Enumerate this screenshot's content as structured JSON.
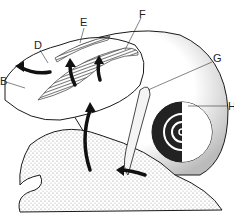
{
  "diagram": {
    "type": "anatomical-illustration",
    "labels": [
      {
        "id": "B",
        "text": "B",
        "x": 0,
        "y": 76
      },
      {
        "id": "D",
        "text": "D",
        "x": 34,
        "y": 40
      },
      {
        "id": "E",
        "text": "E",
        "x": 80,
        "y": 17
      },
      {
        "id": "F",
        "text": "F",
        "x": 139,
        "y": 9
      },
      {
        "id": "G",
        "text": "G",
        "x": 213,
        "y": 53
      },
      {
        "id": "H",
        "text": "H",
        "x": 228,
        "y": 101
      }
    ],
    "colors": {
      "ink": "#1a1a1a",
      "stipple": "#9a9a9a",
      "background": "#ffffff"
    }
  }
}
